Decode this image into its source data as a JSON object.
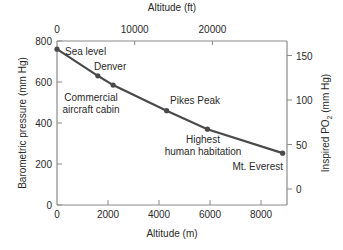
{
  "chart_data": {
    "type": "line",
    "title": "",
    "xlabel": "Altitude (m)",
    "x2label": "Altitude (ft)",
    "ylabel": "Barometric pressure (mm Hg)",
    "y2label_main": "Inspired PO",
    "y2label_sub": "2",
    "y2label_tail": " (mm Hg)",
    "xlim": [
      0,
      8848
    ],
    "ylim": [
      0,
      800
    ],
    "x2lim_ft": [
      0,
      29029
    ],
    "y2lim": [
      0,
      160
    ],
    "grid": false,
    "legend": "none",
    "x_ticks": [
      0,
      2000,
      4000,
      6000,
      8000
    ],
    "x_tick_labels": [
      "0",
      "2000",
      "4000",
      "6000",
      "8000"
    ],
    "y_ticks": [
      0,
      200,
      400,
      600,
      800
    ],
    "y_tick_labels": [
      "0",
      "200",
      "400",
      "600",
      "800"
    ],
    "x2_ticks_ft": [
      0,
      10000,
      20000
    ],
    "x2_tick_labels": [
      "0",
      "10000",
      "20000"
    ],
    "y2_ticks": [
      0,
      50,
      100,
      150
    ],
    "y2_tick_labels": [
      "0",
      "50",
      "100",
      "150"
    ],
    "series": [
      {
        "name": "Barometric pressure",
        "x": [
          0,
          1600,
          2200,
          4300,
          5900,
          8848
        ],
        "y": [
          760,
          630,
          585,
          460,
          370,
          253
        ]
      }
    ],
    "annotations": [
      {
        "text": "Sea level",
        "x": 0,
        "y": 760
      },
      {
        "text": "Denver",
        "x": 1600,
        "y": 630
      },
      {
        "text": "Commercial aircraft cabin",
        "x": 2200,
        "y": 585
      },
      {
        "text": "Pikes Peak",
        "x": 4300,
        "y": 460
      },
      {
        "text": "Highest human habitation",
        "x": 5900,
        "y": 370
      },
      {
        "text": "Mt. Everest",
        "x": 8848,
        "y": 253
      }
    ]
  },
  "labels": {
    "sea_level": "Sea level",
    "denver": "Denver",
    "cabin_line1": "Commercial",
    "cabin_line2": "aircraft cabin",
    "pikes": "Pikes Peak",
    "habitation_line1": "Highest",
    "habitation_line2": "human habitation",
    "everest": "Mt. Everest"
  }
}
